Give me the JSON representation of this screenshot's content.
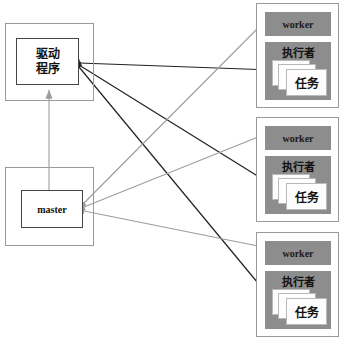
{
  "diagram": {
    "background": "#ffffff",
    "colors": {
      "node_fill": "#ffffff",
      "node_border": "#444444",
      "container_border": "#9a9a9a",
      "worker_panel": "#8d8d8d",
      "task_card": "#fdfdfd",
      "edge_dark": "#222222",
      "edge_light": "#9d9d9d"
    }
  },
  "left_column": {
    "driver": {
      "label_line1": "驱动",
      "label_line2": "程序",
      "container_name": "driver-container"
    },
    "master": {
      "label": "master",
      "container_name": "master-container"
    }
  },
  "workers": [
    {
      "header_label": "worker",
      "executor_label": "执行者",
      "task_label": "任务",
      "task_card_count": 3
    },
    {
      "header_label": "worker",
      "executor_label": "执行者",
      "task_label": "任务",
      "task_card_count": 3
    },
    {
      "header_label": "worker",
      "executor_label": "执行者",
      "task_label": "任务",
      "task_card_count": 3
    }
  ],
  "edges": [
    {
      "name": "master-to-driver",
      "style": "light",
      "from": "master",
      "to": "driver",
      "direction": "up"
    },
    {
      "name": "driver-to-worker-0-executor",
      "style": "dark",
      "from": "driver",
      "to": "worker-0-executor",
      "direction": "bidirectional"
    },
    {
      "name": "driver-to-worker-1-executor",
      "style": "dark",
      "from": "driver",
      "to": "worker-1-executor",
      "direction": "bidirectional"
    },
    {
      "name": "driver-to-worker-2-executor",
      "style": "dark",
      "from": "driver",
      "to": "worker-2-executor",
      "direction": "bidirectional"
    },
    {
      "name": "master-to-worker-0-header",
      "style": "light",
      "from": "master",
      "to": "worker-0-header",
      "direction": "bidirectional"
    },
    {
      "name": "master-to-worker-1-header",
      "style": "light",
      "from": "master",
      "to": "worker-1-header",
      "direction": "bidirectional"
    },
    {
      "name": "master-to-worker-2-header",
      "style": "light",
      "from": "master",
      "to": "worker-2-header",
      "direction": "bidirectional"
    }
  ]
}
